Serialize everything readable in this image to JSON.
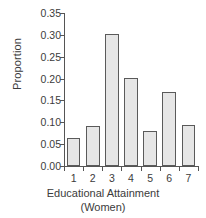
{
  "chart_data": {
    "type": "bar",
    "title": "",
    "categories": [
      "1",
      "2",
      "3",
      "4",
      "5",
      "6",
      "7"
    ],
    "values": [
      0.063,
      0.092,
      0.303,
      0.201,
      0.08,
      0.17,
      0.094
    ],
    "xlabel": "Educational Attainment",
    "xlabel_sub": "(Women)",
    "ylabel": "Proportion",
    "ylim": [
      0.0,
      0.35
    ],
    "ytick_labels": [
      "0.00",
      "0.05",
      "0.10",
      "0.15",
      "0.20",
      "0.25",
      "0.30",
      "0.35"
    ],
    "ytick_values": [
      0.0,
      0.05,
      0.1,
      0.15,
      0.2,
      0.25,
      0.3,
      0.35
    ],
    "grid": false,
    "legend": "none",
    "colors": {
      "bar_fill": "#e6e6e6",
      "bar_edge": "#5a5a5a",
      "axis": "#555555",
      "text": "#3b3b3b",
      "background": "#ffffff"
    }
  }
}
